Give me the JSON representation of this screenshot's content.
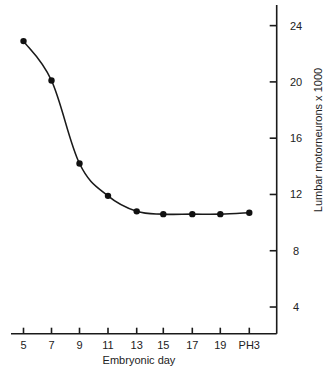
{
  "chart_data": {
    "type": "line",
    "title": "",
    "xlabel": "Embryonic day",
    "ylabel": "Lumbar motorneurons x 1000",
    "categories": [
      "5",
      "7",
      "9",
      "11",
      "13",
      "15",
      "17",
      "19",
      "PH3"
    ],
    "series": [
      {
        "name": "Lumbar motorneurons",
        "values": [
          22.9,
          20.1,
          14.2,
          11.9,
          10.8,
          10.6,
          10.6,
          10.6,
          10.7
        ],
        "marker": "filled-circle",
        "line": "smooth"
      }
    ],
    "yticks": [
      4,
      8,
      12,
      16,
      20,
      24
    ],
    "ylim": [
      2.1,
      25.5
    ],
    "y_axis_position": "right",
    "grid": false,
    "legend": null,
    "colors": {
      "line": "#1a1a1a",
      "marker": "#111111",
      "axis": "#1a1a1a",
      "text": "#222222"
    }
  },
  "axis": {
    "x_title": "Embryonic day",
    "y_title": "Lumbar motorneurons x 1000"
  }
}
